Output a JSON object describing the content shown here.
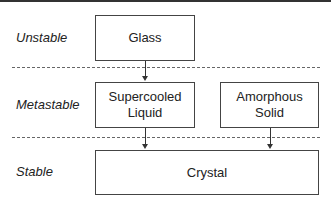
{
  "levels": [
    {
      "label": "Unstable"
    },
    {
      "label": "Metastable"
    },
    {
      "label": "Stable"
    }
  ],
  "nodes": {
    "glass": {
      "label": "Glass"
    },
    "supercooled": {
      "line1": "Supercooled",
      "line2": "Liquid"
    },
    "amorphous": {
      "line1": "Amorphous",
      "line2": "Solid"
    },
    "crystal": {
      "label": "Crystal"
    }
  },
  "edges": [
    {
      "from": "Glass",
      "to": "Supercooled Liquid"
    },
    {
      "from": "Supercooled Liquid",
      "to": "Crystal"
    },
    {
      "from": "Amorphous Solid",
      "to": "Crystal"
    }
  ]
}
